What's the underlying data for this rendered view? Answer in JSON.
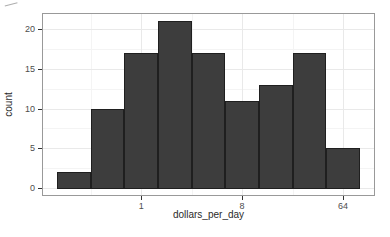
{
  "chart_data": {
    "type": "bar",
    "subtype": "histogram",
    "title": "",
    "xlabel": "dollars_per_day",
    "ylabel": "count",
    "x_scale": "log2",
    "x_ticks": [
      1,
      8,
      64
    ],
    "y_ticks": [
      0,
      5,
      10,
      15,
      20
    ],
    "bins_log2": [
      -2,
      -1,
      0,
      1,
      2,
      3,
      4,
      5,
      6
    ],
    "bin_dollars": [
      0.25,
      0.5,
      1,
      2,
      4,
      8,
      16,
      32,
      64
    ],
    "counts": [
      2,
      10,
      17,
      21,
      17,
      11,
      13,
      17,
      5
    ],
    "ylim": [
      0,
      21
    ],
    "grid": true,
    "legend": "none",
    "colors": {
      "bar_fill": "#3d3d3d",
      "bar_border": "#1f1f1f",
      "panel_border": "#999999",
      "grid_major": "#e9e9e9",
      "grid_minor": "#f4f4f4",
      "tick_mark": "#333333",
      "tick_text": "#4d4d4d",
      "axis_title_text": "#2b2b2b",
      "background": "#ffffff"
    }
  }
}
